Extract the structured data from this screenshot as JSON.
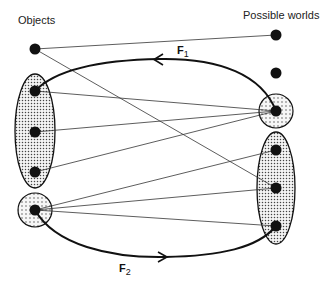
{
  "labels": {
    "objects": "Objects",
    "worlds": "Possible worlds",
    "f1_main": "F",
    "f1_sub": "1",
    "f2_main": "F",
    "f2_sub": "2"
  },
  "nodes": {
    "objects": [
      {
        "id": "o1",
        "x": 35,
        "y": 49,
        "group": "none"
      },
      {
        "id": "o2",
        "x": 35,
        "y": 91,
        "group": "left-ellipse"
      },
      {
        "id": "o3",
        "x": 35,
        "y": 132,
        "group": "left-ellipse"
      },
      {
        "id": "o4",
        "x": 35,
        "y": 172,
        "group": "left-ellipse"
      },
      {
        "id": "o5",
        "x": 35,
        "y": 210,
        "group": "left-circle"
      }
    ],
    "worlds": [
      {
        "id": "w1",
        "x": 276,
        "y": 35,
        "group": "none"
      },
      {
        "id": "w2",
        "x": 276,
        "y": 73,
        "group": "none"
      },
      {
        "id": "w3",
        "x": 276,
        "y": 111,
        "group": "right-circle"
      },
      {
        "id": "w4",
        "x": 276,
        "y": 150,
        "group": "right-ellipse"
      },
      {
        "id": "w5",
        "x": 276,
        "y": 188,
        "group": "right-ellipse"
      },
      {
        "id": "w6",
        "x": 276,
        "y": 226,
        "group": "right-ellipse"
      }
    ]
  },
  "edges": [
    [
      "o1",
      "w1"
    ],
    [
      "o1",
      "w5"
    ],
    [
      "o2",
      "w3"
    ],
    [
      "o3",
      "w3"
    ],
    [
      "o4",
      "w3"
    ],
    [
      "o5",
      "w4"
    ],
    [
      "o5",
      "w5"
    ],
    [
      "o5",
      "w6"
    ]
  ],
  "mappings": [
    {
      "name": "F1",
      "from": "right-circle",
      "to": "left-ellipse",
      "direction": "right-to-left"
    },
    {
      "name": "F2",
      "from": "left-circle",
      "to": "right-ellipse",
      "direction": "left-to-right"
    }
  ]
}
